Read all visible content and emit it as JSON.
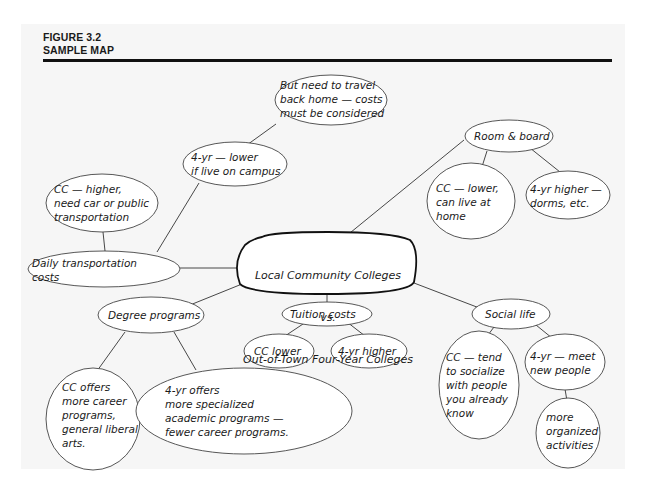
{
  "figure": {
    "number": "FIGURE 3.2",
    "title": "SAMPLE MAP"
  },
  "map": {
    "center": {
      "line1": "Local Community Colleges",
      "line2": "vs.",
      "line3": "Out-of-Town Four-Year Colleges"
    },
    "nodes": {
      "travel_home": "But need to travel\nback home — costs\nmust be considered",
      "fouryr_campus": "4-yr — lower\nif live on campus",
      "cc_transport": "CC — higher,\nneed car or public\ntransportation",
      "daily_transport": "Daily transportation\ncosts",
      "room_board": "Room & board",
      "cc_home": "CC — lower,\ncan live at\nhome",
      "fouryr_dorms": "4-yr higher —\ndorms, etc.",
      "degree_programs": "Degree programs",
      "cc_career": "CC offers\nmore career\nprograms,\ngeneral liberal\narts.",
      "fouryr_academic": "4-yr offers\nmore specialized\nacademic programs —\nfewer career programs.",
      "tuition": "Tuition costs",
      "cc_lower": "CC lower",
      "fouryr_higher": "4-yr higher",
      "social_life": "Social life",
      "cc_socialize": "CC — tend\nto socialize\nwith people\nyou already\nknow",
      "fouryr_meet": "4-yr — meet\nnew people",
      "organized": "more\norganized\nactivities"
    }
  }
}
